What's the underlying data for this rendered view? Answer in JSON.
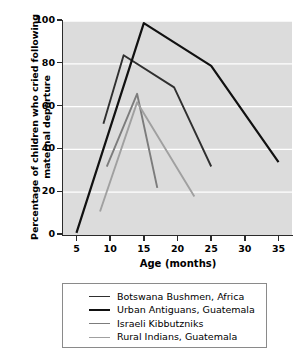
{
  "chart_data": {
    "type": "line",
    "title": "",
    "xlabel": "Age (months)",
    "ylabel": "Percentage of children who cried following maternal departure",
    "xlim": [
      3,
      37
    ],
    "ylim": [
      0,
      100
    ],
    "xticks": [
      5,
      10,
      15,
      20,
      25,
      30,
      35
    ],
    "yticks": [
      0,
      20,
      40,
      60,
      80,
      100
    ],
    "grid": "horizontal-white",
    "legend_position": "below",
    "plot_background": "#dcdcdc",
    "gridline_color": "#ffffff",
    "axis_color": "#2b2b2b",
    "series": [
      {
        "name": "Botswana Bushmen, Africa",
        "color": "#2f2f2f",
        "width": 1.9,
        "x": [
          9,
          12,
          19.5,
          25
        ],
        "values": [
          52,
          84,
          69,
          32
        ]
      },
      {
        "name": "Urban Antiguans, Guatemala",
        "color": "#111111",
        "width": 2.2,
        "x": [
          5,
          15,
          25,
          35
        ],
        "values": [
          1,
          99,
          79,
          34
        ]
      },
      {
        "name": "Israeli Kibbutzniks",
        "color": "#7c7c7c",
        "width": 1.9,
        "x": [
          9.5,
          14,
          17
        ],
        "values": [
          32,
          66,
          22
        ]
      },
      {
        "name": "Rural Indians, Guatemala",
        "color": "#a0a0a0",
        "width": 1.9,
        "x": [
          8.5,
          14,
          22.5
        ],
        "values": [
          11,
          62,
          18
        ]
      }
    ]
  },
  "legend": {
    "entries": [
      "Botswana Bushmen, Africa",
      "Urban Antiguans, Guatemala",
      "Israeli Kibbutzniks",
      "Rural Indians, Guatemala"
    ]
  }
}
